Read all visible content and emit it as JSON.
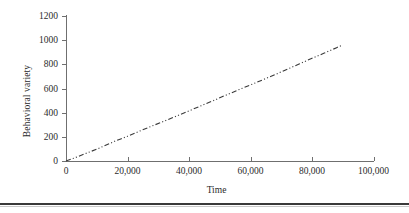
{
  "chart_data": {
    "type": "line",
    "title": "",
    "xlabel": "Time",
    "ylabel": "Behavioral variety",
    "xlim": [
      0,
      100000
    ],
    "ylim": [
      0,
      1200
    ],
    "xticks": [
      0,
      20000,
      40000,
      60000,
      80000,
      100000
    ],
    "xtick_labels": [
      "0",
      "20,000",
      "40,000",
      "60,000",
      "80,000",
      "100,000"
    ],
    "yticks": [
      0,
      200,
      400,
      600,
      800,
      1000,
      1200
    ],
    "ytick_labels": [
      "0",
      "200",
      "400",
      "600",
      "800",
      "1000",
      "1200"
    ],
    "grid": false,
    "legend": null,
    "line_style": "dash-dot-dotted",
    "line_color": "#3a3a3a",
    "series": [
      {
        "name": "Behavioral variety",
        "x": [
          0,
          2000,
          4000,
          6000,
          8000,
          10000,
          12000,
          14000,
          16000,
          18000,
          20000,
          24000,
          28000,
          32000,
          36000,
          40000,
          44000,
          48000,
          52000,
          56000,
          60000,
          64000,
          68000,
          72000,
          76000,
          80000,
          84000,
          88000,
          90000
        ],
        "y": [
          0,
          18,
          38,
          58,
          78,
          98,
          120,
          142,
          165,
          185,
          205,
          248,
          290,
          330,
          372,
          415,
          458,
          500,
          545,
          588,
          630,
          672,
          715,
          760,
          805,
          850,
          893,
          938,
          960
        ]
      }
    ]
  },
  "figure": {
    "background_color": "#ffffff",
    "axis_color": "#6f6f6f",
    "text_color": "#2b2b2b",
    "rule_color": "#3a3a3a"
  }
}
